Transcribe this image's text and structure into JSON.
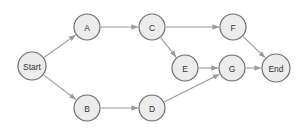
{
  "diagram": {
    "type": "directed-graph",
    "node_fill": "#ececec",
    "node_stroke": "#6e6e6e",
    "edge_color": "#9a9a9a",
    "nodes": [
      {
        "id": "Start",
        "label": "Start",
        "x": 32,
        "y": 66,
        "r": 14
      },
      {
        "id": "A",
        "label": "A",
        "x": 87,
        "y": 27,
        "r": 13
      },
      {
        "id": "B",
        "label": "B",
        "x": 87,
        "y": 108,
        "r": 13
      },
      {
        "id": "C",
        "label": "C",
        "x": 152,
        "y": 27,
        "r": 13
      },
      {
        "id": "D",
        "label": "D",
        "x": 152,
        "y": 108,
        "r": 13
      },
      {
        "id": "E",
        "label": "E",
        "x": 185,
        "y": 68,
        "r": 13
      },
      {
        "id": "F",
        "label": "F",
        "x": 233,
        "y": 27,
        "r": 13
      },
      {
        "id": "G",
        "label": "G",
        "x": 232,
        "y": 68,
        "r": 13
      },
      {
        "id": "End",
        "label": "End",
        "x": 276,
        "y": 68,
        "r": 14
      }
    ],
    "edges": [
      {
        "from": "Start",
        "to": "A"
      },
      {
        "from": "Start",
        "to": "B"
      },
      {
        "from": "A",
        "to": "C"
      },
      {
        "from": "B",
        "to": "D"
      },
      {
        "from": "C",
        "to": "F"
      },
      {
        "from": "C",
        "to": "E"
      },
      {
        "from": "E",
        "to": "G"
      },
      {
        "from": "D",
        "to": "G"
      },
      {
        "from": "F",
        "to": "End"
      },
      {
        "from": "G",
        "to": "End"
      }
    ]
  }
}
